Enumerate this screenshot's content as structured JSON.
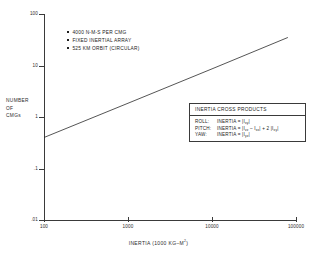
{
  "chart_data": {
    "type": "line",
    "title": "",
    "xlabel": "INERTIA (1000 KG–M2)",
    "xlabel_base": "INERTIA (1000 KG–M",
    "xlabel_sup": "2",
    "xlabel_tail": ")",
    "ylabel_lines": [
      "NUMBER",
      "OF",
      "CMGs"
    ],
    "xscale": "log",
    "yscale": "log",
    "xlim": [
      100,
      100000
    ],
    "ylim": [
      0.01,
      100
    ],
    "xticks": [
      100,
      1000,
      10000,
      100000
    ],
    "xtick_labels": [
      "100",
      "1000",
      "10000",
      "100000"
    ],
    "yticks": [
      0.01,
      0.1,
      1,
      10,
      100
    ],
    "ytick_labels": [
      ".01",
      ".1",
      "1",
      "10",
      "100"
    ],
    "grid": false,
    "legend": "none",
    "series": [
      {
        "name": "CMG count vs inertia",
        "x": [
          100,
          1000,
          10000,
          80000
        ],
        "y": [
          0.4,
          1.85,
          8.6,
          35.0
        ]
      }
    ],
    "annotations": [
      "4000 N-M-S PER CMG",
      "FIXED INERTIAL ARRAY",
      "525 KM ORBIT (CIRCULAR)"
    ]
  },
  "notes": {
    "items": [
      {
        "text": "4000 N-M-S PER CMG"
      },
      {
        "text": "FIXED INERTIAL ARRAY"
      },
      {
        "text": "525 KM ORBIT (CIRCULAR)"
      }
    ]
  },
  "cross_products": {
    "header": "INERTIA CROSS PRODUCTS",
    "rows": [
      {
        "axis": "ROLL:",
        "formula_pre": "INERTIA = |I",
        "sub1": "xy",
        "formula_mid": "|",
        "sub2": "",
        "formula_post": "",
        "sub3": "",
        "formula_end": ""
      },
      {
        "axis": "PITCH:",
        "formula_pre": "INERTIA = |I",
        "sub1": "zz",
        "formula_mid": " – I",
        "sub2": "xx",
        "formula_post": "| + 2 |I",
        "sub3": "xy",
        "formula_end": "|"
      },
      {
        "axis": "YAW:",
        "formula_pre": "INERTIA = |I",
        "sub1": "yz",
        "formula_mid": "|",
        "sub2": "",
        "formula_post": "",
        "sub3": "",
        "formula_end": ""
      }
    ]
  },
  "colors": {
    "axis": "#3a3a3a",
    "curve": "#2a2a2a",
    "text": "#232323",
    "background": "#ffffff"
  }
}
